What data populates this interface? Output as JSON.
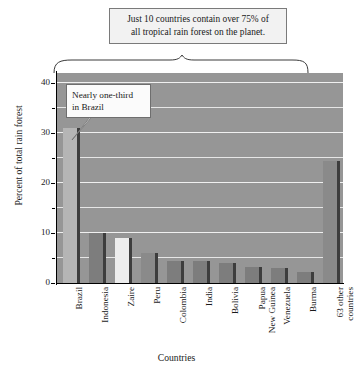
{
  "annotations": {
    "top_note_line1": "Just 10 countries contain over 75% of",
    "top_note_line2": "all tropical rain forest on the planet.",
    "brazil_note_line1": "Nearly one-third",
    "brazil_note_line2": "in Brazil"
  },
  "chart_data": {
    "type": "bar",
    "title": "",
    "xlabel": "Countries",
    "ylabel": "Percent of total rain forest",
    "ylim": [
      0,
      42
    ],
    "yticks": [
      0,
      10,
      20,
      30,
      40
    ],
    "yticks_minor": [
      5,
      15,
      25,
      35
    ],
    "grid": true,
    "legend": "none",
    "categories": [
      "Brazil",
      "Indonesia",
      "Zaire",
      "Peru",
      "Colombia",
      "India",
      "Bolivia",
      "Papua New Guinea",
      "Venezuela",
      "Burma",
      "63 other countries"
    ],
    "category_lines": [
      [
        "Brazil"
      ],
      [
        "Indonesia"
      ],
      [
        "Zaire"
      ],
      [
        "Peru"
      ],
      [
        "Colombia"
      ],
      [
        "India"
      ],
      [
        "Bolivia"
      ],
      [
        "Papua",
        "New Guinea"
      ],
      [
        "Venezuela"
      ],
      [
        "Burma"
      ],
      [
        "63 other",
        "countries"
      ]
    ],
    "values": [
      31,
      10,
      9,
      6,
      4.5,
      4.5,
      4,
      3.3,
      3,
      2.2,
      24.5
    ],
    "bar_colors": [
      "#b5b5b5",
      "#7d7d7d",
      "#ededed",
      "#8a8a8a",
      "#7d7d7d",
      "#7d7d7d",
      "#7d7d7d",
      "#7d7d7d",
      "#7d7d7d",
      "#7d7d7d",
      "#8a8a8a"
    ],
    "plot_background": "#969696",
    "gridline_color": "#f0f0f0"
  },
  "axis_tick_labels": {
    "t0": "0",
    "t10": "10",
    "t20": "20",
    "t30": "30",
    "t40": "40"
  }
}
